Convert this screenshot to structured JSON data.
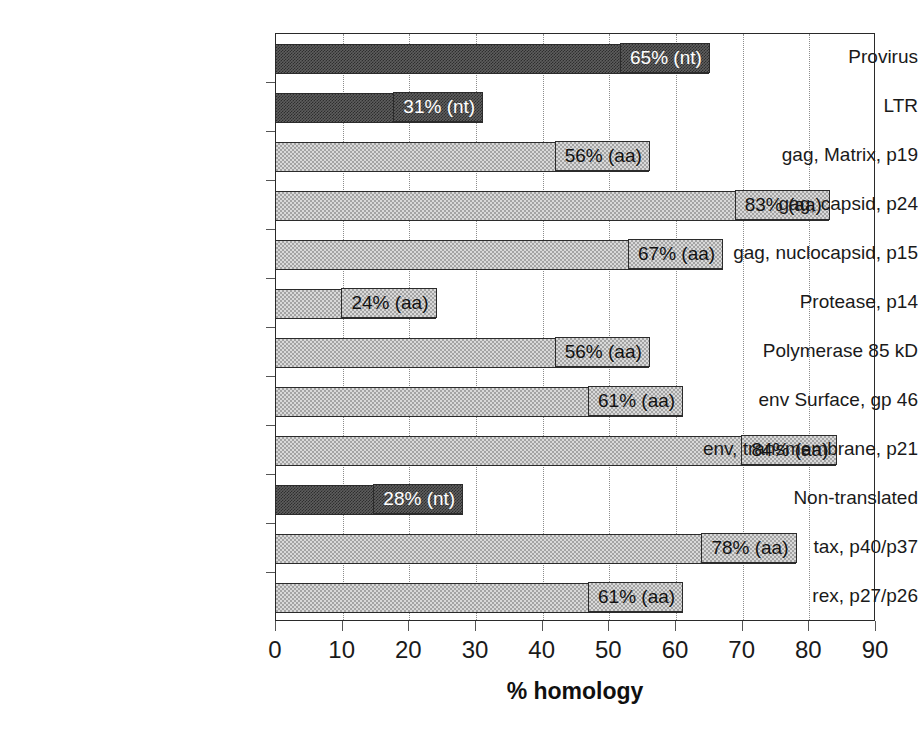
{
  "chart_data": {
    "type": "bar",
    "orientation": "horizontal",
    "title": "",
    "xlabel": "% homology",
    "ylabel": "",
    "xlim": [
      0,
      90
    ],
    "xticks": [
      0,
      10,
      20,
      30,
      40,
      50,
      60,
      70,
      80,
      90
    ],
    "grid": "vertical-dotted",
    "legend": "none",
    "categories": [
      "Provirus",
      "LTR",
      "gag, Matrix, p19",
      "gag, capsid, p24",
      "gag, nuclocapsid, p15",
      "Protease, p14",
      "Polymerase 85 kD",
      "env Surface, gp 46",
      "env, transmembrane, p21",
      "Non-translated",
      "tax, p40/p37",
      "rex, p27/p26"
    ],
    "values": [
      65,
      31,
      56,
      83,
      67,
      24,
      56,
      61,
      84,
      28,
      78,
      61
    ],
    "data_labels": [
      "65% (nt)",
      "31% (nt)",
      "56% (aa)",
      "83% (aa)",
      "67% (aa)",
      "24% (aa)",
      "56% (aa)",
      "61% (aa)",
      "84% (aa)",
      "28% (nt)",
      "78% (aa)",
      "61% (aa)"
    ],
    "series_units": [
      "nt",
      "nt",
      "aa",
      "aa",
      "aa",
      "aa",
      "aa",
      "aa",
      "aa",
      "nt",
      "aa",
      "aa"
    ],
    "bar_styles": [
      "dark",
      "dark",
      "light",
      "light",
      "light",
      "light",
      "light",
      "light",
      "light",
      "dark",
      "light",
      "light"
    ],
    "colors": {
      "dark_bar": "#5e5e5e",
      "light_bar": "#d9d9d9",
      "bar_outline": "#2b2b2b",
      "axis": "#2a2a2a",
      "gridline": "#8c8c8c",
      "text": "#1a1a1a",
      "dark_bar_label_text": "#ffffff",
      "background": "#ffffff"
    }
  }
}
